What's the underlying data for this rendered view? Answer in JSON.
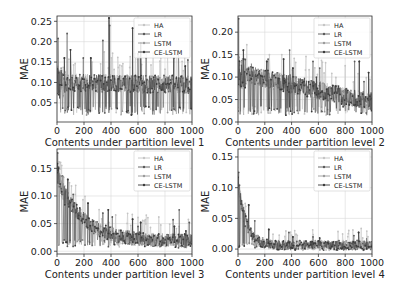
{
  "figure": {
    "width": 401,
    "height": 294,
    "background": "#ffffff"
  },
  "legend": {
    "entries": [
      {
        "name": "HA",
        "color": "#c4c4c4"
      },
      {
        "name": "LR",
        "color": "#5a5a5a"
      },
      {
        "name": "LSTM",
        "color": "#9a9a9a"
      },
      {
        "name": "CE-LSTM",
        "color": "#3a3a3a"
      }
    ]
  },
  "chart_data": [
    {
      "type": "line",
      "title": "",
      "xlabel": "Contents under partition level 1",
      "ylabel": "MAE",
      "xlim": [
        0,
        1000
      ],
      "ylim": [
        0.003,
        0.263
      ],
      "xticks": [
        0,
        200,
        400,
        600,
        800,
        1000
      ],
      "yticks": [
        0.05,
        0.1,
        0.15,
        0.2,
        0.25
      ],
      "ytick_labels": [
        "0.05",
        "0.10",
        "0.15",
        "0.20",
        "0.25"
      ],
      "grid": true,
      "legend_position": "upper right",
      "frame": {
        "left": 57,
        "top": 16,
        "right": 192,
        "bottom": 122
      },
      "series": [
        "HA",
        "LR",
        "LSTM",
        "CE-LSTM"
      ],
      "trend": {
        "start": 0.1,
        "end": 0.095,
        "decay": 0,
        "noise": 0.022,
        "dip_min": 0.02
      },
      "spikes": [
        [
          8,
          0.208
        ],
        [
          55,
          0.16
        ],
        [
          75,
          0.22
        ],
        [
          100,
          0.18
        ],
        [
          195,
          0.16
        ],
        [
          250,
          0.16
        ],
        [
          340,
          0.203
        ],
        [
          385,
          0.258
        ],
        [
          390,
          0.24
        ],
        [
          560,
          0.233
        ],
        [
          600,
          0.17
        ],
        [
          620,
          0.197
        ],
        [
          660,
          0.16
        ],
        [
          865,
          0.16
        ],
        [
          900,
          0.175
        ],
        [
          950,
          0.14
        ],
        [
          970,
          0.155
        ]
      ]
    },
    {
      "type": "line",
      "title": "",
      "xlabel": "Contents under partition level 2",
      "ylabel": "MAE",
      "xlim": [
        0,
        1000
      ],
      "ylim": [
        0.0,
        0.236
      ],
      "xticks": [
        0,
        200,
        400,
        600,
        800,
        1000
      ],
      "yticks": [
        0.0,
        0.05,
        0.1,
        0.15,
        0.2
      ],
      "ytick_labels": [
        "0.00",
        "0.05",
        "0.10",
        "0.15",
        "0.20"
      ],
      "grid": true,
      "legend_position": "upper right",
      "frame": {
        "left": 238,
        "top": 16,
        "right": 372,
        "bottom": 122
      },
      "series": [
        "HA",
        "LR",
        "LSTM",
        "CE-LSTM"
      ],
      "trend": {
        "start": 0.11,
        "end": 0.045,
        "decay": 0,
        "noise": 0.02,
        "dip_min": 0.015
      },
      "spikes": [
        [
          5,
          0.23
        ],
        [
          40,
          0.16
        ],
        [
          100,
          0.13
        ],
        [
          215,
          0.135
        ],
        [
          225,
          0.14
        ],
        [
          340,
          0.14
        ],
        [
          385,
          0.16
        ],
        [
          410,
          0.12
        ],
        [
          560,
          0.135
        ],
        [
          585,
          0.1
        ],
        [
          610,
          0.12
        ],
        [
          730,
          0.08
        ],
        [
          870,
          0.135
        ],
        [
          905,
          0.135
        ],
        [
          940,
          0.09
        ],
        [
          975,
          0.11
        ]
      ]
    },
    {
      "type": "line",
      "title": "",
      "xlabel": "Contents under partition level 3",
      "ylabel": "MAE",
      "xlim": [
        0,
        1000
      ],
      "ylim": [
        -0.005,
        0.185
      ],
      "xticks": [
        0,
        200,
        400,
        600,
        800,
        1000
      ],
      "yticks": [
        0.0,
        0.05,
        0.1,
        0.15
      ],
      "ytick_labels": [
        "0.00",
        "0.05",
        "0.10",
        "0.15"
      ],
      "grid": true,
      "legend_position": "upper right",
      "frame": {
        "left": 57,
        "top": 149,
        "right": 192,
        "bottom": 254
      },
      "series": [
        "HA",
        "LR",
        "LSTM",
        "CE-LSTM"
      ],
      "trend": {
        "start": 0.14,
        "end": 0.018,
        "decay": 180,
        "noise": 0.013,
        "dip_min": 0.008
      },
      "spikes": [
        [
          5,
          0.178
        ],
        [
          80,
          0.13
        ],
        [
          120,
          0.103
        ],
        [
          230,
          0.087
        ],
        [
          340,
          0.069
        ],
        [
          380,
          0.075
        ],
        [
          410,
          0.062
        ],
        [
          560,
          0.058
        ],
        [
          600,
          0.045
        ],
        [
          620,
          0.052
        ],
        [
          860,
          0.057
        ],
        [
          870,
          0.045
        ],
        [
          905,
          0.075
        ],
        [
          955,
          0.037
        ],
        [
          980,
          0.052
        ]
      ]
    },
    {
      "type": "line",
      "title": "",
      "xlabel": "Contents under partition level 4",
      "ylabel": "MAE",
      "xlim": [
        0,
        1000
      ],
      "ylim": [
        -0.008,
        0.163
      ],
      "xticks": [
        0,
        200,
        400,
        600,
        800,
        1000
      ],
      "yticks": [
        0.0,
        0.05,
        0.1,
        0.15
      ],
      "ytick_labels": [
        "0.00",
        "0.05",
        "0.10",
        "0.15"
      ],
      "grid": true,
      "legend_position": "upper right",
      "frame": {
        "left": 238,
        "top": 149,
        "right": 372,
        "bottom": 254
      },
      "series": [
        "HA",
        "LR",
        "LSTM",
        "CE-LSTM"
      ],
      "trend": {
        "start": 0.11,
        "end": 0.006,
        "decay": 60,
        "noise": 0.008,
        "dip_min": 0.002
      },
      "spikes": [
        [
          5,
          0.125
        ],
        [
          80,
          0.072
        ],
        [
          125,
          0.046
        ],
        [
          230,
          0.032
        ],
        [
          380,
          0.027
        ],
        [
          410,
          0.02
        ],
        [
          560,
          0.02
        ],
        [
          610,
          0.018
        ],
        [
          865,
          0.022
        ],
        [
          900,
          0.027
        ],
        [
          960,
          0.018
        ]
      ]
    }
  ]
}
